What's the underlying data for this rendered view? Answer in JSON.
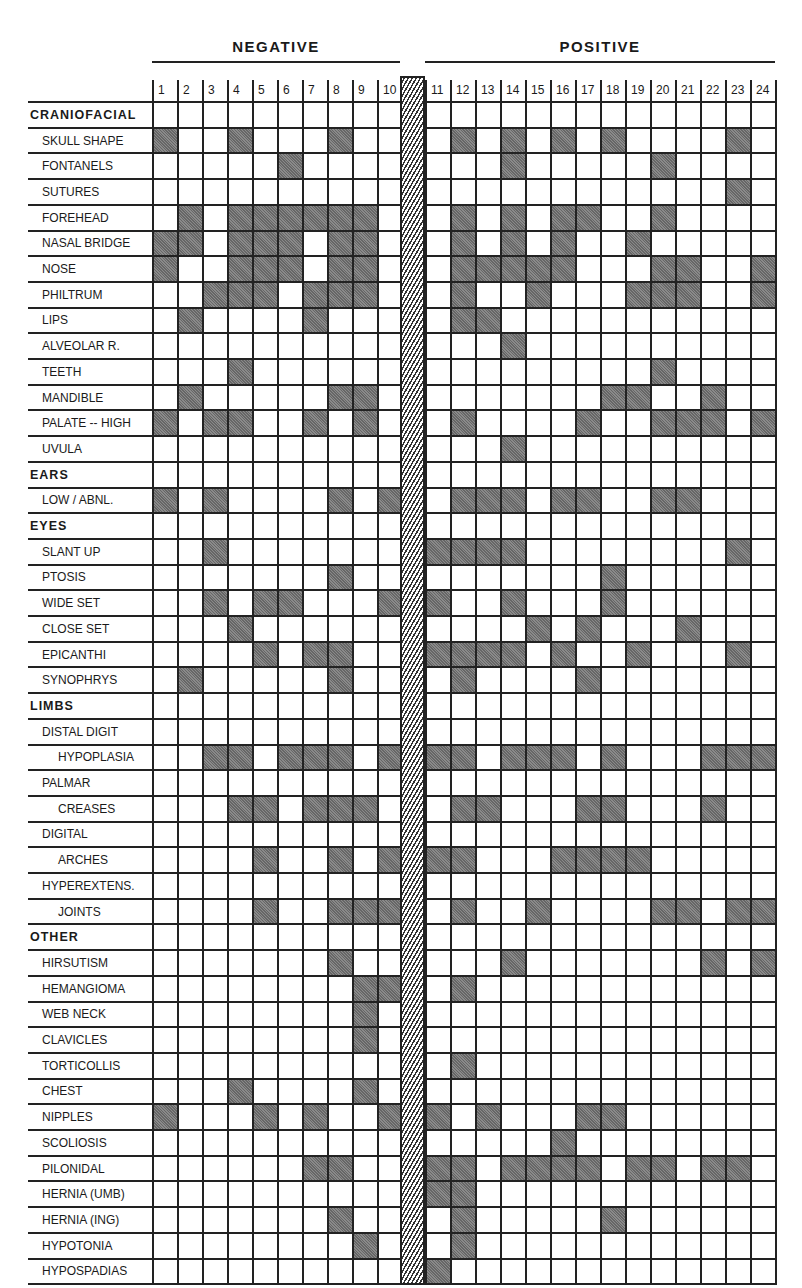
{
  "chart_data": {
    "type": "heatmap",
    "title": "",
    "groups": [
      {
        "name": "NEGATIVE",
        "columns": [
          1,
          2,
          3,
          4,
          5,
          6,
          7,
          8,
          9,
          10
        ]
      },
      {
        "name": "POSITIVE",
        "columns": [
          11,
          12,
          13,
          14,
          15,
          16,
          17,
          18,
          19,
          20,
          21,
          22,
          23,
          24
        ]
      }
    ],
    "columns": [
      1,
      2,
      3,
      4,
      5,
      6,
      7,
      8,
      9,
      10,
      11,
      12,
      13,
      14,
      15,
      16,
      17,
      18,
      19,
      20,
      21,
      22,
      23,
      24
    ],
    "legend": {
      "shaded": "feature present",
      "blank": "feature absent"
    },
    "rows": [
      {
        "label": "CRANIOFACIAL",
        "kind": "section",
        "on": []
      },
      {
        "label": "SKULL SHAPE",
        "kind": "item",
        "on": [
          1,
          4,
          8,
          12,
          14,
          16,
          18,
          23
        ]
      },
      {
        "label": "FONTANELS",
        "kind": "item",
        "on": [
          6,
          14,
          20
        ]
      },
      {
        "label": "SUTURES",
        "kind": "item",
        "on": [
          23
        ]
      },
      {
        "label": "FOREHEAD",
        "kind": "item",
        "on": [
          2,
          4,
          5,
          6,
          7,
          8,
          9,
          12,
          14,
          16,
          17,
          20
        ]
      },
      {
        "label": "NASAL BRIDGE",
        "kind": "item",
        "on": [
          1,
          2,
          4,
          5,
          6,
          8,
          9,
          12,
          14,
          16,
          19
        ]
      },
      {
        "label": "NOSE",
        "kind": "item",
        "on": [
          1,
          4,
          5,
          6,
          8,
          9,
          12,
          13,
          14,
          15,
          16,
          20,
          21,
          24
        ]
      },
      {
        "label": "PHILTRUM",
        "kind": "item",
        "on": [
          3,
          4,
          5,
          7,
          8,
          9,
          12,
          15,
          19,
          20,
          21,
          24
        ]
      },
      {
        "label": "LIPS",
        "kind": "item",
        "on": [
          2,
          7,
          12,
          13
        ]
      },
      {
        "label": "ALVEOLAR R.",
        "kind": "item",
        "on": [
          14
        ]
      },
      {
        "label": "TEETH",
        "kind": "item",
        "on": [
          4,
          20
        ]
      },
      {
        "label": "MANDIBLE",
        "kind": "item",
        "on": [
          2,
          8,
          9,
          18,
          19,
          22
        ]
      },
      {
        "label": "PALATE -- HIGH",
        "kind": "item",
        "on": [
          1,
          3,
          4,
          7,
          9,
          12,
          17,
          20,
          21,
          22,
          24
        ]
      },
      {
        "label": "UVULA",
        "kind": "item",
        "on": [
          14
        ]
      },
      {
        "label": "EARS",
        "kind": "section",
        "on": []
      },
      {
        "label": "LOW / ABNL.",
        "kind": "item",
        "on": [
          1,
          3,
          8,
          10,
          12,
          13,
          14,
          16,
          17,
          20,
          21
        ]
      },
      {
        "label": "EYES",
        "kind": "section",
        "on": []
      },
      {
        "label": "SLANT UP",
        "kind": "item",
        "on": [
          3,
          11,
          12,
          13,
          14,
          23
        ]
      },
      {
        "label": "PTOSIS",
        "kind": "item",
        "on": [
          8,
          18
        ]
      },
      {
        "label": "WIDE SET",
        "kind": "item",
        "on": [
          3,
          5,
          6,
          10,
          11,
          14,
          18
        ]
      },
      {
        "label": "CLOSE SET",
        "kind": "item",
        "on": [
          4,
          15,
          17,
          21
        ]
      },
      {
        "label": "EPICANTHI",
        "kind": "item",
        "on": [
          5,
          7,
          8,
          11,
          12,
          13,
          14,
          16,
          19,
          23
        ]
      },
      {
        "label": "SYNOPHRYS",
        "kind": "item",
        "on": [
          2,
          8,
          12,
          17
        ]
      },
      {
        "label": "LIMBS",
        "kind": "section",
        "on": []
      },
      {
        "label": "DISTAL DIGIT",
        "kind": "item",
        "on": []
      },
      {
        "label": "HYPOPLASIA",
        "kind": "sub",
        "on": [
          3,
          4,
          6,
          7,
          8,
          10,
          11,
          12,
          14,
          15,
          16,
          18,
          22,
          23,
          24
        ]
      },
      {
        "label": "PALMAR",
        "kind": "item",
        "on": []
      },
      {
        "label": "CREASES",
        "kind": "sub",
        "on": [
          4,
          5,
          7,
          8,
          9,
          12,
          13,
          17,
          18,
          22
        ]
      },
      {
        "label": "DIGITAL",
        "kind": "item",
        "on": []
      },
      {
        "label": "ARCHES",
        "kind": "sub",
        "on": [
          5,
          8,
          10,
          11,
          12,
          16,
          17,
          18,
          19
        ]
      },
      {
        "label": "HYPEREXTENS.",
        "kind": "item",
        "on": []
      },
      {
        "label": "JOINTS",
        "kind": "sub",
        "on": [
          5,
          8,
          9,
          10,
          12,
          15,
          20,
          21,
          23,
          24
        ]
      },
      {
        "label": "OTHER",
        "kind": "section",
        "on": []
      },
      {
        "label": "HIRSUTISM",
        "kind": "item",
        "on": [
          8,
          14,
          22,
          24
        ]
      },
      {
        "label": "HEMANGIOMA",
        "kind": "item",
        "on": [
          9,
          10,
          12
        ]
      },
      {
        "label": "WEB NECK",
        "kind": "item",
        "on": [
          9
        ]
      },
      {
        "label": "CLAVICLES",
        "kind": "item",
        "on": [
          9
        ]
      },
      {
        "label": "TORTICOLLIS",
        "kind": "item",
        "on": [
          12
        ]
      },
      {
        "label": "CHEST",
        "kind": "item",
        "on": [
          4,
          9
        ]
      },
      {
        "label": "NIPPLES",
        "kind": "item",
        "on": [
          1,
          5,
          7,
          10,
          11,
          13,
          17,
          18
        ]
      },
      {
        "label": "SCOLIOSIS",
        "kind": "item",
        "on": [
          16
        ]
      },
      {
        "label": "PILONIDAL",
        "kind": "item",
        "on": [
          7,
          8,
          11,
          12,
          14,
          15,
          16,
          17,
          19,
          20,
          22,
          23
        ]
      },
      {
        "label": "HERNIA (UMB)",
        "kind": "item",
        "on": [
          11,
          12
        ]
      },
      {
        "label": "HERNIA (ING)",
        "kind": "item",
        "on": [
          8,
          12,
          18
        ]
      },
      {
        "label": "HYPOTONIA",
        "kind": "item",
        "on": [
          9,
          12
        ]
      },
      {
        "label": "HYPOSPADIAS",
        "kind": "item",
        "on": [
          11
        ]
      }
    ]
  },
  "header": {
    "negative_label": "NEGATIVE",
    "positive_label": "POSITIVE"
  },
  "colors": {
    "shaded": "#7d7d7d",
    "grid": "#222222",
    "background": "#ffffff"
  }
}
